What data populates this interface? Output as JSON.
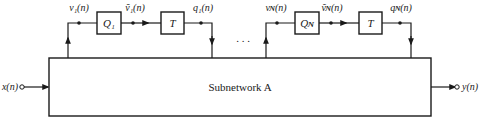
{
  "diagram": {
    "subnetwork_label": "Subnetwork A",
    "input_label": "x(n)",
    "output_label": "y(n)",
    "ellipsis": ". . .",
    "loops": [
      {
        "v_label": "v₁(n)",
        "vhat_label": "ṽ₁(n)",
        "q_label": "q₁(n)",
        "quantizer_label": "Q₁",
        "delay_label": "T"
      },
      {
        "v_label": "vɴ(n)",
        "vhat_label": "ṽɴ(n)",
        "q_label": "qɴ(n)",
        "quantizer_label": "Qɴ",
        "delay_label": "T"
      }
    ],
    "colors": {
      "stroke": "#1a1a1a",
      "background": "#ffffff"
    }
  }
}
